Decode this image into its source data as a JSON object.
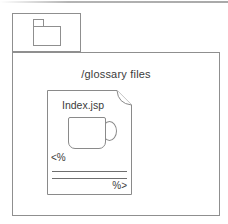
{
  "figure": {
    "folder": {
      "label": "/glossary files",
      "icon": "folder-icon"
    },
    "file": {
      "name": "Index.jsp",
      "icon": "jsp-document-icon",
      "logo_icon": "coffee-mug-icon",
      "scriptlet_open": "<%",
      "scriptlet_close": "%>"
    }
  },
  "colors": {
    "shape_line": "#8f8f8f",
    "code_line": "#6f6f6f",
    "text": "#3b3b3b",
    "background": "#ffffff"
  }
}
